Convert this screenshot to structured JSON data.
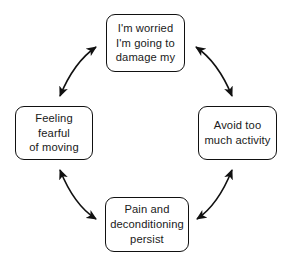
{
  "diagram": {
    "type": "cycle",
    "stroke_color": "#111111",
    "background_color": "#ffffff",
    "nodes": [
      {
        "id": "worry",
        "label": "I'm worried\nI'm going to\ndamage my",
        "position": "top"
      },
      {
        "id": "avoid",
        "label": "Avoid too\nmuch activity",
        "position": "right"
      },
      {
        "id": "pain",
        "label": "Pain and\ndeconditioning\npersist",
        "position": "bottom"
      },
      {
        "id": "fear",
        "label": "Feeling fearful\nof moving",
        "position": "left"
      }
    ],
    "connectors": [
      {
        "id": "worry-avoid",
        "from": "worry",
        "to": "avoid",
        "style": "curved",
        "heads": "double"
      },
      {
        "id": "avoid-pain",
        "from": "avoid",
        "to": "pain",
        "style": "curved",
        "heads": "double"
      },
      {
        "id": "pain-fear",
        "from": "pain",
        "to": "fear",
        "style": "curved",
        "heads": "double"
      },
      {
        "id": "fear-worry",
        "from": "fear",
        "to": "worry",
        "style": "curved",
        "heads": "double"
      }
    ]
  }
}
